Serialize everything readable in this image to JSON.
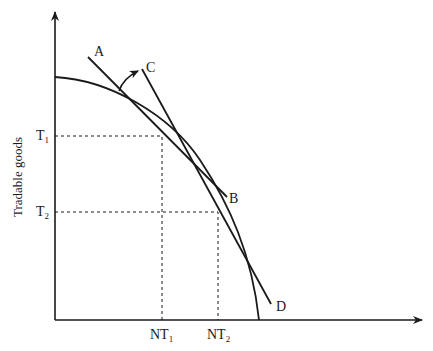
{
  "diagram": {
    "y_axis_label": "Tradable goods",
    "x_axis_label": "",
    "points": {
      "A": "A",
      "B": "B",
      "C": "C",
      "D": "D"
    },
    "y_ticks": [
      {
        "base": "T",
        "sub": "1"
      },
      {
        "base": "T",
        "sub": "2"
      }
    ],
    "x_ticks": [
      {
        "base": "NT",
        "sub": "1"
      },
      {
        "base": "NT",
        "sub": "2"
      }
    ],
    "colors": {
      "line": "#1a1a1a",
      "background": "#ffffff"
    }
  }
}
